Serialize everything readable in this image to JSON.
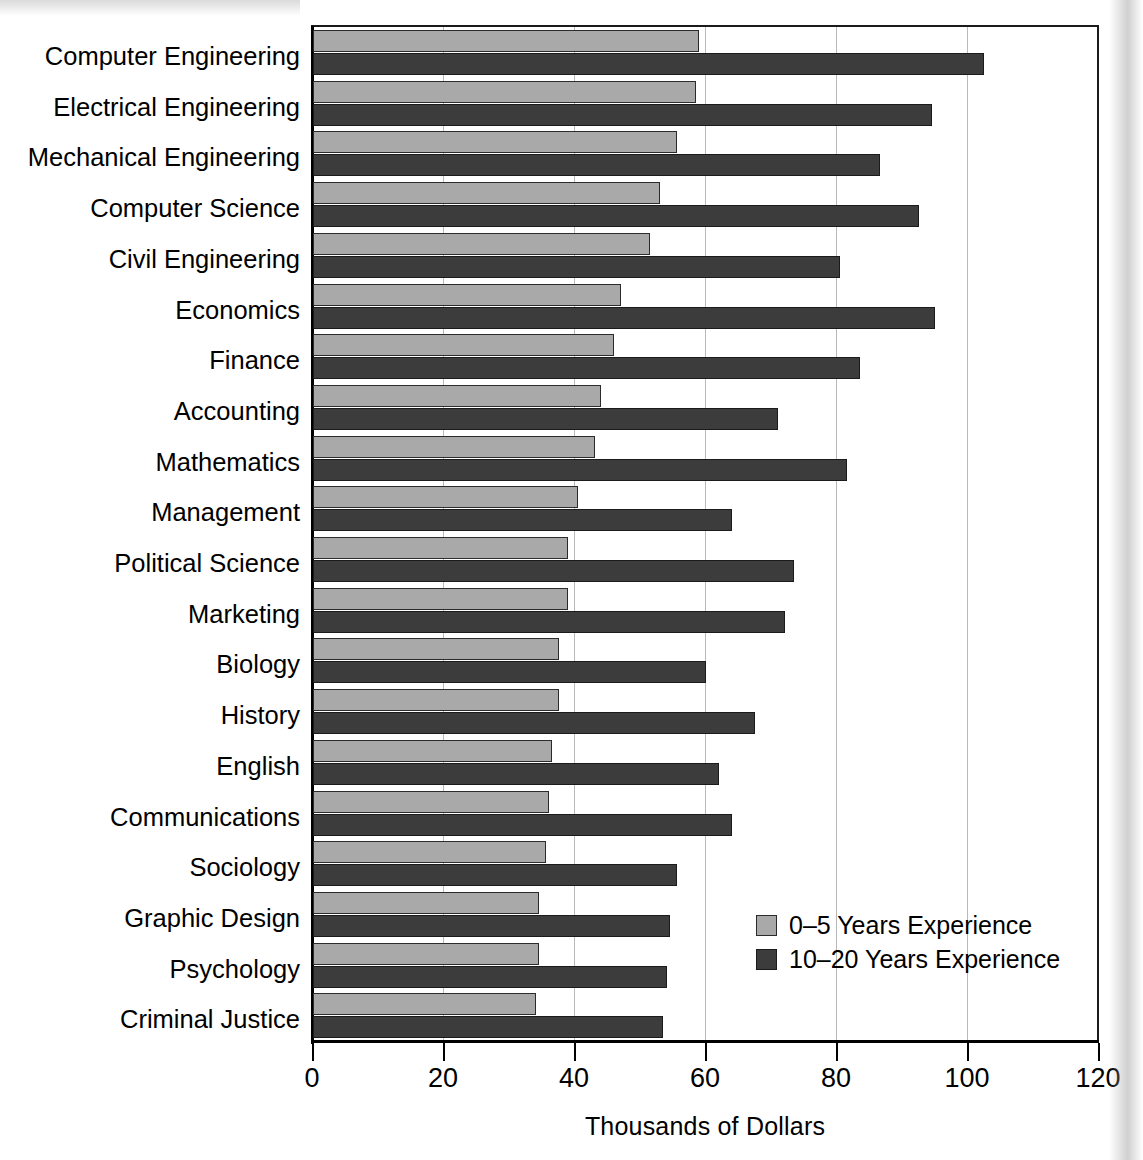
{
  "chart_data": {
    "type": "bar",
    "orientation": "horizontal",
    "title": "",
    "xlabel": "Thousands of Dollars",
    "ylabel": "",
    "xlim": [
      0,
      120
    ],
    "xticks": [
      0,
      20,
      40,
      60,
      80,
      100,
      120
    ],
    "xtick_labels": [
      "0",
      "20",
      "40",
      "60",
      "80",
      "100",
      "120"
    ],
    "grid": true,
    "grid_axis": "x",
    "legend_position": "lower right",
    "categories": [
      "Computer Engineering",
      "Electrical Engineering",
      "Mechanical Engineering",
      "Computer Science",
      "Civil Engineering",
      "Economics",
      "Finance",
      "Accounting",
      "Mathematics",
      "Management",
      "Political Science",
      "Marketing",
      "Biology",
      "History",
      "English",
      "Communications",
      "Sociology",
      "Graphic Design",
      "Psychology",
      "Criminal Justice"
    ],
    "series": [
      {
        "name": "0–5 Years Experience",
        "color": "#a9a9a9",
        "values": [
          59,
          58.5,
          55.5,
          53,
          51.5,
          47,
          46,
          44,
          43,
          40.5,
          39,
          39,
          37.5,
          37.5,
          36.5,
          36,
          35.5,
          34.5,
          34.5,
          34
        ]
      },
      {
        "name": "10–20 Years Experience",
        "color": "#3c3c3c",
        "values": [
          102.5,
          94.5,
          86.5,
          92.5,
          80.5,
          95,
          83.5,
          71,
          81.5,
          64,
          73.5,
          72,
          60,
          67.5,
          62,
          64,
          55.5,
          54.5,
          54,
          53.5
        ]
      }
    ]
  },
  "legend": {
    "items": [
      {
        "label": "0–5 Years Experience",
        "swatch": "light-gray-swatch"
      },
      {
        "label": "10–20 Years Experience",
        "swatch": "dark-gray-swatch"
      }
    ]
  },
  "axis": {
    "x_title": "Thousands of Dollars"
  }
}
